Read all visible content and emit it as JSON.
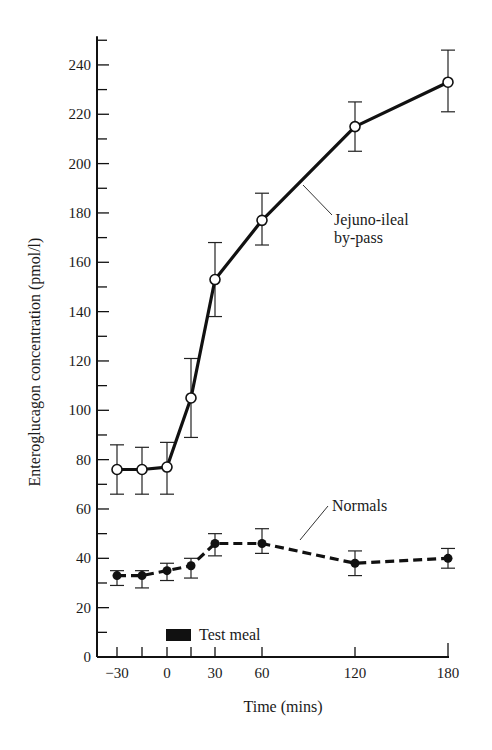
{
  "chart_data": {
    "type": "line",
    "title": "",
    "xlabel": "Time (mins)",
    "ylabel": "Enteroglucagon concentration (pmol/l)",
    "x_ticks": [
      -30,
      0,
      30,
      60,
      120,
      180
    ],
    "x_tick_labels": [
      "−30",
      "0",
      "30",
      "60",
      "120",
      "180"
    ],
    "x_minor_ticks": [
      -15,
      15
    ],
    "y_ticks": [
      0,
      20,
      40,
      60,
      80,
      100,
      120,
      140,
      160,
      180,
      200,
      220,
      240
    ],
    "ylim": [
      0,
      250
    ],
    "grid": false,
    "legend": "inline annotations",
    "x": [
      -30,
      -15,
      0,
      15,
      30,
      60,
      120,
      180
    ],
    "series": [
      {
        "name": "Jejuno-ileal by-pass",
        "style": "solid, open circles",
        "values": [
          76,
          76,
          77,
          105,
          153,
          177,
          215,
          233
        ],
        "error_low": [
          66,
          66,
          66,
          89,
          138,
          167,
          205,
          221
        ],
        "error_high": [
          86,
          85,
          87,
          121,
          168,
          188,
          225,
          246
        ]
      },
      {
        "name": "Normals",
        "style": "dashed, filled circles",
        "values": [
          33,
          33,
          35,
          37,
          46,
          46,
          38,
          40
        ],
        "error_low": [
          29,
          28,
          31,
          32,
          41,
          42,
          33,
          36
        ],
        "error_high": [
          35,
          35,
          38,
          40,
          50,
          52,
          43,
          44
        ]
      }
    ],
    "annotations": [
      {
        "text": "Jejuno-ileal",
        "line2": "by-pass",
        "target_series": "Jejuno-ileal by-pass"
      },
      {
        "text": "Normals",
        "target_series": "Normals"
      },
      {
        "text": "Test meal",
        "marker": "black bar",
        "x_span": [
          0,
          15
        ]
      }
    ]
  }
}
